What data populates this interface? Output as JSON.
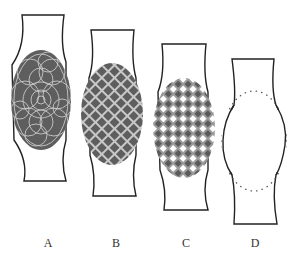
{
  "figure": {
    "colors": {
      "outline": "#222222",
      "dark_fill": "#5e5e5e",
      "light_line": "#c8c8c8",
      "white": "#ffffff",
      "dots": "#555555"
    },
    "panels": [
      {
        "id": "A",
        "label": "A",
        "pattern": "overlapping-circles"
      },
      {
        "id": "B",
        "label": "B",
        "pattern": "diagonal-lattice"
      },
      {
        "id": "C",
        "label": "C",
        "pattern": "checkered-diamonds"
      },
      {
        "id": "D",
        "label": "D",
        "pattern": "dotted-outline-only"
      }
    ]
  }
}
